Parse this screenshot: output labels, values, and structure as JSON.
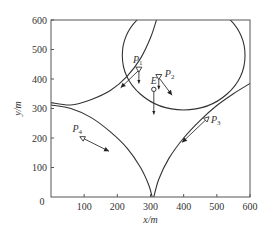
{
  "chart_data": {
    "type": "line",
    "title": "",
    "xlabel": "x/m",
    "ylabel": "y/m",
    "xlim": [
      0,
      600
    ],
    "ylim": [
      0,
      600
    ],
    "xticks": [
      0,
      100,
      200,
      300,
      400,
      500,
      600
    ],
    "yticks": [
      0,
      100,
      200,
      300,
      400,
      500,
      600
    ],
    "xtick_labels": [
      "100",
      "200",
      "300",
      "400",
      "500",
      "600"
    ],
    "ytick_labels": [
      "0",
      "100",
      "200",
      "300",
      "400",
      "500",
      "600"
    ],
    "grid": false,
    "curves": [
      {
        "name": "boundary-P1",
        "points": [
          [
            0,
            320
          ],
          [
            60,
            312
          ],
          [
            120,
            330
          ],
          [
            180,
            362
          ],
          [
            230,
            410
          ],
          [
            270,
            470
          ],
          [
            300,
            540
          ],
          [
            318,
            600
          ]
        ]
      },
      {
        "name": "boundary-P4",
        "points": [
          [
            0,
            312
          ],
          [
            60,
            300
          ],
          [
            120,
            270
          ],
          [
            180,
            220
          ],
          [
            230,
            165
          ],
          [
            270,
            100
          ],
          [
            295,
            40
          ],
          [
            305,
            0
          ]
        ]
      },
      {
        "name": "boundary-P3",
        "points": [
          [
            310,
            0
          ],
          [
            325,
            60
          ],
          [
            355,
            130
          ],
          [
            400,
            200
          ],
          [
            450,
            260
          ],
          [
            500,
            310
          ],
          [
            550,
            350
          ],
          [
            600,
            385
          ]
        ]
      },
      {
        "name": "circle-P2",
        "type": "circle",
        "center": [
          400,
          480
        ],
        "radius": 185
      }
    ],
    "points": [
      {
        "label": "P",
        "sub": "1",
        "x": 265,
        "y": 430,
        "marker": "triangle-down-open",
        "arrows": [
          {
            "dx": -55,
            "dy": -60,
            "style": "filled"
          },
          {
            "dx": 0,
            "dy": -45,
            "style": "line"
          }
        ]
      },
      {
        "label": "P",
        "sub": "2",
        "x": 325,
        "y": 405,
        "marker": "triangle-down-open",
        "arrows": [
          {
            "dx": 40,
            "dy": -60,
            "style": "filled"
          },
          {
            "dx": 0,
            "dy": -40,
            "style": "line"
          }
        ]
      },
      {
        "label": "P",
        "sub": "3",
        "x": 470,
        "y": 265,
        "marker": "triangle-open",
        "arrows": [
          {
            "dx": -75,
            "dy": -80,
            "style": "filled"
          }
        ]
      },
      {
        "label": "P",
        "sub": "4",
        "x": 95,
        "y": 200,
        "marker": "triangle-open",
        "arrows": [
          {
            "dx": 80,
            "dy": -45,
            "style": "filled"
          }
        ]
      },
      {
        "label": "E",
        "sub": "",
        "x": 310,
        "y": 365,
        "marker": "circle-open",
        "arrows": [
          {
            "dx": 0,
            "dy": -85,
            "style": "line"
          }
        ]
      }
    ],
    "origin_label": "0"
  }
}
